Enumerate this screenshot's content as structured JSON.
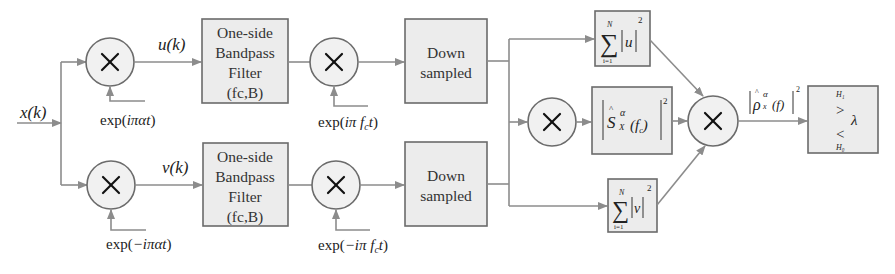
{
  "diagram": {
    "type": "signal-processing-block-diagram",
    "colors": {
      "block_fill": "#ececec",
      "block_stroke": "#6b6b6b",
      "wire": "#8c8c8c",
      "text": "#222222"
    },
    "input": {
      "label": "x(k)"
    },
    "upper_branch": {
      "mixer1": {
        "symbol": "×",
        "ref_label": "exp(iπαt)"
      },
      "signal_label": "u(k)",
      "filter": {
        "lines": [
          "One-side",
          "Bandpass",
          "Filter",
          "(fc,B)"
        ]
      },
      "mixer2": {
        "symbol": "×",
        "ref_label": "exp(iπ f_c t)"
      },
      "downsampler": {
        "lines": [
          "Down",
          "sampled"
        ]
      }
    },
    "lower_branch": {
      "mixer1": {
        "symbol": "×",
        "ref_label": "exp(−iπαt)"
      },
      "signal_label": "v(k)",
      "filter": {
        "lines": [
          "One-side",
          "Bandpass",
          "Filter",
          "(fc,B)"
        ]
      },
      "mixer2": {
        "symbol": "×",
        "ref_label": "exp(−iπ f_c t)"
      },
      "downsampler": {
        "lines": [
          "Down",
          "sampled"
        ]
      }
    },
    "energy_u": {
      "sum_upper": "N",
      "sum_lower": "i=1",
      "var": "u",
      "power": "2"
    },
    "energy_v": {
      "sum_upper": "N",
      "sum_lower": "i=1",
      "var": "v",
      "power": "2"
    },
    "cross_mixer": {
      "symbol": "×"
    },
    "scf_block": {
      "label": "|Ŝ_X^α(f_c)|²",
      "base": "S",
      "sup": "α",
      "sub": "X",
      "arg": "(f_c)",
      "power": "2"
    },
    "combine_mixer": {
      "symbol": "×"
    },
    "output_label": {
      "text": "|ρ̂_x^α(f)|²",
      "base": "ρ",
      "sup": "α",
      "sub": "x",
      "arg": "(f)",
      "power": "2"
    },
    "decision": {
      "h1": "H₁",
      "gt": ">",
      "threshold": "λ",
      "lt": "<",
      "h0": "H₀"
    }
  }
}
